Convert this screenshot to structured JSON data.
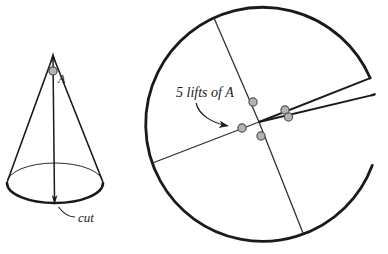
{
  "figure": {
    "colors": {
      "stroke": "#1a1a1a",
      "thin_stroke": "#2b2b2b",
      "dot_fill": "#b3b3b3",
      "dot_stroke": "#555555",
      "background": "#ffffff"
    },
    "labels": {
      "cut": "cut",
      "apex_point": "A",
      "lifts": "5 lifts of A"
    },
    "left_diagram": {
      "name": "cone",
      "apex": {
        "x": 53,
        "y": 55
      },
      "base_center": {
        "x": 55,
        "y": 183
      },
      "base_rx": 48,
      "base_ry": 20,
      "axis_label": "A",
      "marked_point": {
        "x": 53,
        "y": 71
      },
      "callout": "cut"
    },
    "right_diagram": {
      "name": "unrolled-cone-disk",
      "circle_center": {
        "x": 259,
        "y": 122
      },
      "circle_radius": 117,
      "gap_start_deg": -32,
      "gap_end_deg": -22,
      "callout": "5 lifts of A",
      "lift_count": 5,
      "lift_points": [
        {
          "x": 253,
          "y": 102
        },
        {
          "x": 285,
          "y": 110
        },
        {
          "x": 288,
          "y": 117
        },
        {
          "x": 242,
          "y": 128
        },
        {
          "x": 261,
          "y": 136
        }
      ],
      "radii": [
        {
          "from": "center",
          "to": {
            "x": 214,
            "y": 18
          }
        },
        {
          "from": "center",
          "to": {
            "x": 303,
            "y": 233
          }
        },
        {
          "from": "center",
          "to": {
            "x": 158,
            "y": 170
          }
        },
        {
          "from": "center",
          "to": {
            "x": 371,
            "y": 70
          }
        },
        {
          "from": "center",
          "to": {
            "x": 373,
            "y": 91
          }
        }
      ]
    }
  }
}
